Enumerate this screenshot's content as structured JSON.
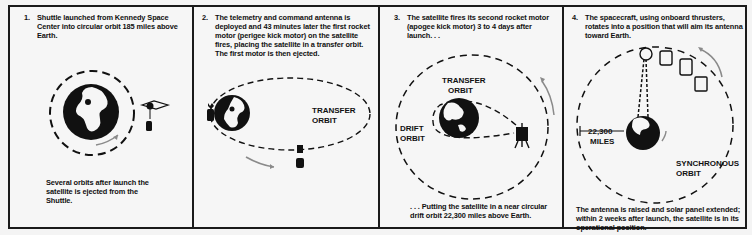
{
  "panels": [
    {
      "number": "1.",
      "text": "Shuttle launched from Kennedy Space Center into circular orbit 185 miles above Earth.",
      "caption": "Several orbits after launch the satellite is ejected from the Shuttle.",
      "labels": []
    },
    {
      "number": "2.",
      "text": "The telemetry and command antenna is deployed and 43 minutes later the first rocket motor (perigee kick motor) on the satellite fires, placing the satellite in a transfer orbit. The first motor is then ejected.",
      "caption": "",
      "labels": [
        "TRANSFER",
        "ORBIT"
      ]
    },
    {
      "number": "3.",
      "text": "The satellite fires its second rocket motor (apogee kick motor) 3 to 4 days after launch. . .",
      "caption": ". . . Putting the satellite in a near circular drift orbit 22,300 miles above Earth.",
      "labels": [
        "TRANSFER",
        "ORBIT",
        "DRIFT",
        "ORBIT"
      ]
    },
    {
      "number": "4.",
      "text": "The spacecraft, using onboard thrusters, rotates into a position that will aim its antenna toward Earth.",
      "caption": "The antenna is raised and solar panel extended; within 2 weeks after launch, the satellite is in its operational position.",
      "labels": [
        "22,300",
        "MILES",
        "SYNCHRONOUS",
        "ORBIT"
      ]
    }
  ],
  "colors": {
    "ink": "#111111",
    "paper": "#f6f6f6",
    "arrow": "#8a8a8a"
  }
}
